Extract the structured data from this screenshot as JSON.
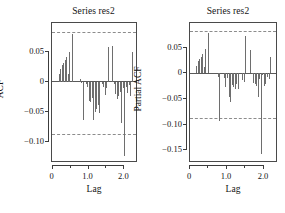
{
  "figure": {
    "width": 285,
    "height": 213,
    "background": "#ffffff",
    "bar_color": "#6e6e6e",
    "axis_color": "#3c3c3c",
    "conf_color": "#8c8c8c"
  },
  "panels": [
    {
      "id": "acf",
      "title": "Series res2",
      "ylabel": "ACF",
      "xlabel": "Lag"
    },
    {
      "id": "pacf",
      "title": "Series res2",
      "ylabel": "Partial ACF",
      "xlabel": "Lag"
    }
  ],
  "chart_data": [
    {
      "type": "bar",
      "id": "acf",
      "title": "Series res2",
      "xlabel": "Lag",
      "ylabel": "ACF",
      "xlim": [
        -0.02,
        2.38
      ],
      "ylim": [
        -0.135,
        0.098
      ],
      "xticks": [
        0,
        1.0,
        2.0
      ],
      "xticklabels": [
        "0",
        "1.0",
        "2.0"
      ],
      "xminorticks": [
        0.5,
        1.5
      ],
      "yticks": [
        0.05,
        0,
        -0.05,
        -0.1
      ],
      "yticklabels": [
        "0.05",
        "0",
        "-0.05",
        "-0.10"
      ],
      "grid": false,
      "legend": false,
      "confidence_bands": [
        0.083,
        -0.087
      ],
      "zero_line": 0,
      "x": [
        0.0,
        0.0417,
        0.0833,
        0.125,
        0.1667,
        0.2083,
        0.25,
        0.2917,
        0.3333,
        0.375,
        0.4167,
        0.4583,
        0.5,
        0.5417,
        0.5833,
        0.625,
        0.6667,
        0.7083,
        0.75,
        0.7917,
        0.8333,
        0.875,
        0.9167,
        0.9583,
        1.0,
        1.0417,
        1.0833,
        1.125,
        1.1667,
        1.2083,
        1.25,
        1.2917,
        1.3333,
        1.375,
        1.4167,
        1.4583,
        1.5,
        1.5417,
        1.5833,
        1.625,
        1.6667,
        1.7083,
        1.75,
        1.7917,
        1.8333,
        1.875,
        1.9167,
        1.9583,
        2.0,
        2.0417,
        2.0833,
        2.125,
        2.1667,
        2.2083,
        2.25,
        2.2917,
        2.3333
      ],
      "values": [
        0.0,
        0.0,
        0.0,
        0.0,
        0.013,
        0.021,
        0.028,
        0.0315,
        0.037,
        0.041,
        0.0125,
        0.05,
        0.0,
        0.079,
        0.0,
        0.0,
        0.0,
        0.0,
        0.004,
        -0.001,
        -0.064,
        0.0,
        -0.004,
        -0.009,
        -0.032,
        -0.034,
        -0.027,
        -0.063,
        -0.05,
        -0.045,
        -0.039,
        -0.051,
        0.0,
        -0.004,
        -0.008,
        -0.022,
        -0.011,
        0.058,
        0.0,
        0.0,
        0.06,
        -0.004,
        -0.021,
        -0.028,
        -0.0235,
        -0.017,
        -0.069,
        -0.011,
        -0.124,
        -0.009,
        -0.019,
        -0.006,
        -0.024,
        0.049,
        0.0,
        0.0,
        -0.002
      ]
    },
    {
      "type": "bar",
      "id": "pacf",
      "title": "Series res2",
      "xlabel": "Lag",
      "ylabel": "Partial ACF",
      "xlim": [
        0.0,
        2.38
      ],
      "ylim": [
        -0.175,
        0.098
      ],
      "xticks": [
        0,
        1.0,
        2.0
      ],
      "xticklabels": [
        "0",
        "1.0",
        "2.0"
      ],
      "xminorticks": [
        0.5,
        1.5
      ],
      "yticks": [
        0.05,
        0,
        -0.05,
        -0.1,
        -0.15
      ],
      "yticklabels": [
        "0.05",
        "0",
        "-0.05",
        "-0.10",
        "-0.15"
      ],
      "grid": false,
      "legend": false,
      "confidence_bands": [
        0.083,
        -0.087
      ],
      "zero_line": 0,
      "x": [
        0.0417,
        0.0833,
        0.125,
        0.1667,
        0.2083,
        0.25,
        0.2917,
        0.3333,
        0.375,
        0.4167,
        0.4583,
        0.5,
        0.5417,
        0.5833,
        0.625,
        0.6667,
        0.7083,
        0.75,
        0.7917,
        0.8333,
        0.875,
        0.9167,
        0.9583,
        1.0,
        1.0417,
        1.0833,
        1.125,
        1.1667,
        1.2083,
        1.25,
        1.2917,
        1.3333,
        1.375,
        1.4167,
        1.4583,
        1.5,
        1.5417,
        1.5833,
        1.625,
        1.6667,
        1.7083,
        1.75,
        1.7917,
        1.8333,
        1.875,
        1.9167,
        1.9583,
        2.0,
        2.0417,
        2.0833,
        2.125,
        2.1667,
        2.2083,
        2.25,
        2.2917,
        2.3333
      ],
      "values": [
        0.0,
        0.0,
        0.0,
        0.014,
        0.023,
        0.028,
        0.032,
        0.038,
        0.0125,
        0.047,
        0.0,
        0.079,
        0.0,
        0.0,
        0.0,
        0.0,
        0.0,
        -0.008,
        -0.093,
        0.0,
        0.0,
        -0.009,
        -0.026,
        -0.01,
        -0.047,
        -0.057,
        -0.022,
        -0.026,
        -0.031,
        -0.021,
        -0.03,
        0.0,
        0.0,
        -0.013,
        -0.018,
        0.073,
        0.0,
        0.0,
        0.045,
        -0.001,
        -0.019,
        -0.02,
        -0.024,
        -0.046,
        -0.011,
        -0.157,
        -0.003,
        -0.024,
        -0.021,
        -0.008,
        -0.011,
        0.031,
        0.0,
        0.0,
        0.0,
        0.0
      ]
    }
  ]
}
